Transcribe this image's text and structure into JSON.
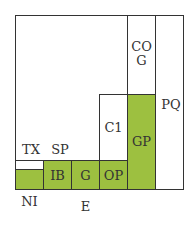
{
  "diagram": {
    "type": "nested-block-diagram",
    "colors": {
      "fill": "#9dc040",
      "stroke": "#333333",
      "background": "#ffffff"
    },
    "blocks": [
      {
        "id": "outer",
        "label": ""
      },
      {
        "id": "pq",
        "label": "PQ"
      },
      {
        "id": "cog",
        "label": "CO\nG"
      },
      {
        "id": "gp",
        "label": "GP"
      },
      {
        "id": "c1",
        "label": "C1"
      },
      {
        "id": "op",
        "label": "OP"
      },
      {
        "id": "g",
        "label": "G"
      },
      {
        "id": "ib",
        "label": "IB"
      },
      {
        "id": "ni",
        "label": "NI"
      },
      {
        "id": "tx",
        "label": "TX"
      },
      {
        "id": "sp",
        "label": "SP"
      },
      {
        "id": "e",
        "label": "E"
      }
    ]
  }
}
